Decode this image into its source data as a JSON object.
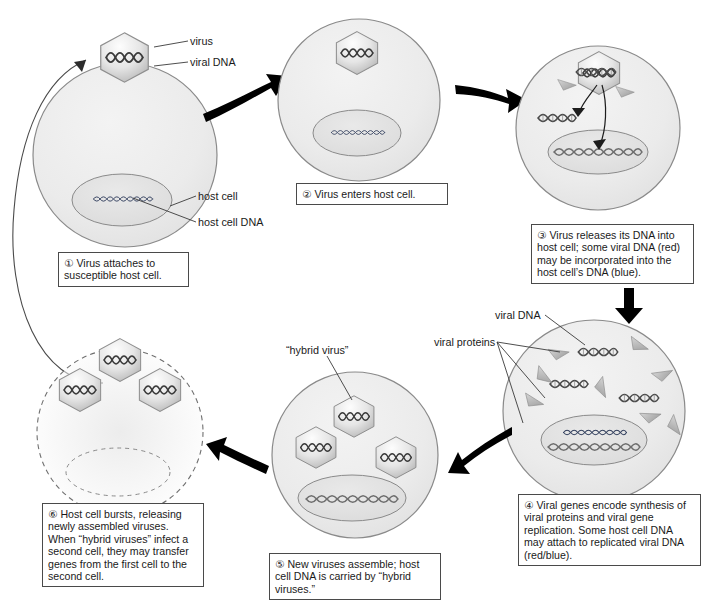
{
  "diagram": {
    "labels": {
      "virus": "virus",
      "viral_dna": "viral DNA",
      "host_cell": "host cell",
      "host_cell_dna": "host cell DNA",
      "viral_dna_2": "viral DNA",
      "viral_proteins": "viral proteins",
      "hybrid_virus": "“hybrid virus”"
    },
    "steps": [
      {
        "num": "①",
        "text": "Virus attaches to susceptible host cell."
      },
      {
        "num": "②",
        "text": "Virus enters host cell."
      },
      {
        "num": "③",
        "text": "Virus releases its DNA into host cell; some viral DNA (red) may be incorporated into the host cell’s DNA (blue)."
      },
      {
        "num": "④",
        "text": "Viral genes encode synthesis of viral proteins and viral gene replication. Some host cell DNA may attach to replicated viral DNA (red/blue)."
      },
      {
        "num": "⑤",
        "text": "New viruses assemble; host cell DNA is carried by “hybrid viruses.”"
      },
      {
        "num": "⑥",
        "text": "Host cell bursts, releasing newly assembled viruses. When “hybrid viruses” infect a second cell, they may transfer genes from the first cell to the second cell."
      }
    ],
    "icons": {
      "virus_capsid": "hexagon-virus-icon",
      "dna_helix": "dna-helix-icon",
      "protein": "protein-triangle-icon",
      "arrow": "arrow-icon",
      "cell": "cell-circle-icon",
      "nucleus": "nucleus-ellipse-icon"
    },
    "colors": {
      "cell_fill": "#ececec",
      "nucleus_fill": "#e3e3e3",
      "outline": "#8a8a8a",
      "arrow": "#000000",
      "viral_dna": "#6b6b6b",
      "host_dna": "#2f3a56",
      "background": "#ffffff"
    }
  }
}
